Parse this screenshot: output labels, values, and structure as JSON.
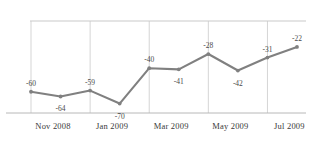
{
  "chart_data": {
    "type": "line",
    "title": "",
    "subtitle": "",
    "xlabel": "",
    "ylabel": "",
    "grid": true,
    "legend": false,
    "legend_position": "none",
    "series_color": "#808080",
    "zero_line_value": 0,
    "x": [
      "Nov 2008",
      "Dec 2008",
      "Jan 2009",
      "Feb 2009",
      "Mar 2009",
      "Apr 2009",
      "May 2009",
      "Jun 2009",
      "Jul 2009",
      "Aug 2009"
    ],
    "values": [
      -60,
      -64,
      -59,
      -70,
      -40,
      -41,
      -28,
      -42,
      -31,
      -22
    ],
    "point_labels": [
      "-60",
      "-64",
      "-59",
      "-70",
      "-40",
      "-41",
      "-28",
      "-42",
      "-31",
      "-22"
    ],
    "label_positions": [
      "above",
      "below",
      "above",
      "below",
      "above",
      "below",
      "above",
      "below",
      "above",
      "above"
    ],
    "xticks": [
      "Nov 2008",
      "Jan 2009",
      "Mar 2009",
      "May 2009",
      "Jul 2009"
    ],
    "xtick_indices": [
      0,
      2,
      4,
      6,
      8
    ],
    "ylim": [
      -78,
      0
    ],
    "xlim": [
      0,
      9
    ]
  }
}
